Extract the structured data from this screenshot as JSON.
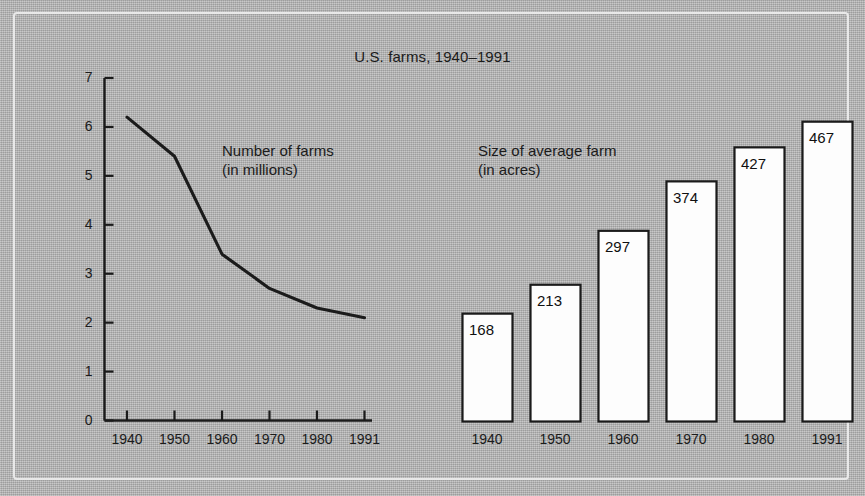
{
  "figure": {
    "title": "U.S. farms, 1940–1991",
    "background_color": "#b3b3b3",
    "frame_color": "#e9e9e9",
    "ink_color": "#1b1b1b",
    "bar_fill_color": "#fdfdfd"
  },
  "legends": {
    "line_label_line1": "Number of farms",
    "line_label_line2": "(in millions)",
    "bar_label_line1": "Size of average farm",
    "bar_label_line2": "(in acres)"
  },
  "chart_data": [
    {
      "type": "line",
      "title": "Number of farms (in millions)",
      "xlabel": "",
      "ylabel": "",
      "categories": [
        "1940",
        "1950",
        "1960",
        "1970",
        "1980",
        "1991"
      ],
      "x": [
        1940,
        1950,
        1960,
        1970,
        1980,
        1991
      ],
      "values": [
        6.2,
        5.4,
        3.4,
        2.7,
        2.3,
        2.1
      ],
      "ytick_labels": [
        "0",
        "1",
        "2",
        "3",
        "4",
        "5",
        "6",
        "7"
      ],
      "yticks": [
        0,
        1,
        2,
        3,
        4,
        5,
        6,
        7
      ],
      "ylim": [
        0,
        7
      ],
      "grid": false,
      "legend_position": "inside-upper-right",
      "annotations": [
        "Number of farms",
        "(in millions)"
      ]
    },
    {
      "type": "bar",
      "title": "Size of average farm (in acres)",
      "xlabel": "",
      "ylabel": "",
      "categories": [
        "1940",
        "1950",
        "1960",
        "1970",
        "1980",
        "1991"
      ],
      "values": [
        168,
        213,
        297,
        374,
        427,
        467
      ],
      "value_labels": [
        "168",
        "213",
        "297",
        "374",
        "427",
        "467"
      ],
      "ylim": [
        0,
        500
      ],
      "grid": false,
      "legend_position": "inside-upper-left",
      "annotations": [
        "Size of average farm",
        "(in acres)"
      ]
    }
  ]
}
